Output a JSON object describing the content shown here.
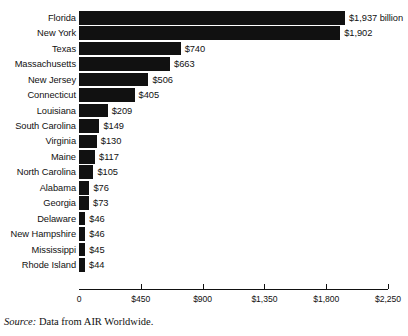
{
  "chart_data": {
    "type": "bar",
    "orientation": "horizontal",
    "title": "",
    "subtitle": "",
    "xlabel": "",
    "ylabel": "",
    "xlim": [
      0,
      2250
    ],
    "grid": false,
    "legend": null,
    "axis_ticks": [
      "0",
      "$450",
      "$900",
      "$1,350",
      "$1,800",
      "$2,250"
    ],
    "axis_tick_values": [
      0,
      450,
      900,
      1350,
      1800,
      2250
    ],
    "categories": [
      "Florida",
      "New York",
      "Texas",
      "Massachusetts",
      "New Jersey",
      "Connecticut",
      "Louisiana",
      "South Carolina",
      "Virginia",
      "Maine",
      "North Carolina",
      "Alabama",
      "Georgia",
      "Delaware",
      "New Hampshire",
      "Mississippi",
      "Rhode Island"
    ],
    "values": [
      1937,
      1902,
      740,
      663,
      506,
      405,
      209,
      149,
      130,
      117,
      105,
      76,
      73,
      46,
      46,
      45,
      44
    ],
    "value_labels": [
      "$1,937 billion",
      "$1,902",
      "$740",
      "$663",
      "$506",
      "$405",
      "$209",
      "$149",
      "$130",
      "$117",
      "$105",
      "$76",
      "$73",
      "$46",
      "$46",
      "$45",
      "$44"
    ],
    "bar_color": "#111111",
    "background_color": "#ffffff"
  },
  "source": {
    "label": "Source:",
    "text": " Data from AIR Worldwide."
  }
}
